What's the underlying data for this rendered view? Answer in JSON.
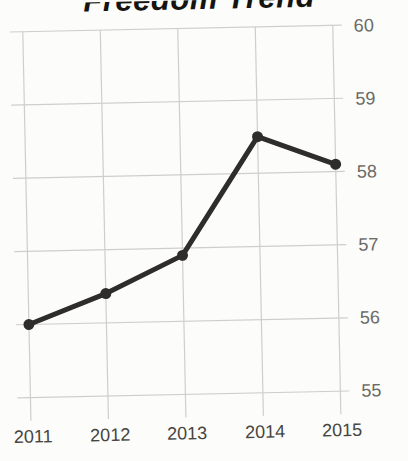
{
  "chart_data": {
    "type": "line",
    "title": "Freedom Trend",
    "x": [
      2011,
      2012,
      2013,
      2014,
      2015
    ],
    "values": [
      56.0,
      56.4,
      56.9,
      58.5,
      58.1
    ],
    "xlabel": "",
    "ylabel": "",
    "ylim": [
      55,
      60
    ],
    "yticks": [
      60,
      59,
      58,
      57,
      56,
      55
    ],
    "grid": "on",
    "legend": "none",
    "colors": {
      "line": "#2e2d2b",
      "point": "#2e2d2b",
      "gridline": "#cfcecb",
      "xtick_text": "#46453f",
      "ytick_text": "#6b6a66",
      "title_text": "#151410",
      "background": "#fcfcfa"
    }
  }
}
